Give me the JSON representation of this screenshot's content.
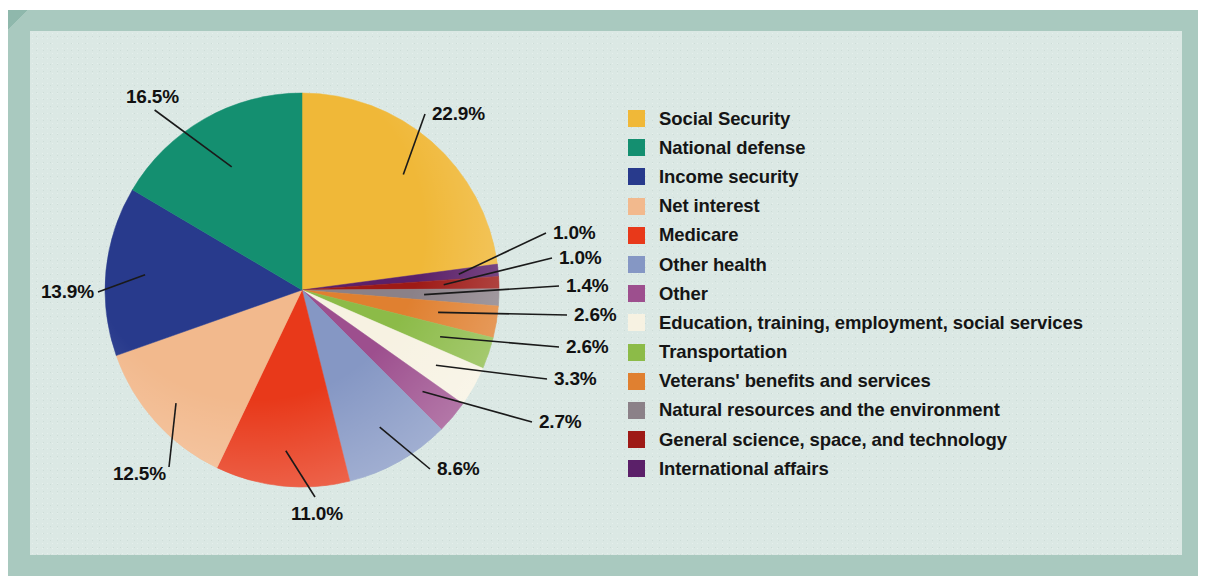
{
  "figure": {
    "background_color": "#dbe8e4",
    "frame_color": "#a9c9bf",
    "frame_shadow_color": "#8fb8ac"
  },
  "chart_data": {
    "type": "pie",
    "title": "",
    "subtitle": "",
    "xlabel": "",
    "ylabel": "",
    "legend_position": "right",
    "grid": false,
    "start_angle_deg": 0,
    "direction": "clockwise",
    "center": {
      "x": 302,
      "y": 290
    },
    "radius": 197,
    "categories": [
      "Social Security",
      "National defense",
      "Income security",
      "Net interest",
      "Medicare",
      "Other health",
      "Other",
      "Education, training, employment, social services",
      "Transportation",
      "Veterans' benefits and services",
      "Natural resources and the environment",
      "General science, space, and technology",
      "International affairs"
    ],
    "values": [
      22.9,
      16.5,
      13.9,
      12.5,
      11.0,
      8.6,
      2.7,
      3.3,
      2.6,
      2.6,
      1.4,
      1.0,
      1.0
    ],
    "value_labels": [
      "22.9%",
      "16.5%",
      "13.9%",
      "12.5%",
      "11.0%",
      "8.6%",
      "2.7%",
      "3.3%",
      "2.6%",
      "2.6%",
      "1.4%",
      "1.0%",
      "1.0%"
    ],
    "colors": [
      "#f0b838",
      "#148f70",
      "#283a8c",
      "#f2b98d",
      "#e8391a",
      "#8597c4",
      "#9d4f8e",
      "#f7f2e2",
      "#8cbb48",
      "#e08030",
      "#8b8188",
      "#9e1a16",
      "#5b2069"
    ],
    "slice_order_clockwise_from_top": [
      {
        "label": "Social Security",
        "value": 22.9,
        "color": "#f0b838"
      },
      {
        "label": "International affairs",
        "value": 1.0,
        "color": "#5b2069"
      },
      {
        "label": "General science, space, and technology",
        "value": 1.0,
        "color": "#9e1a16"
      },
      {
        "label": "Natural resources and the environment",
        "value": 1.4,
        "color": "#8b8188"
      },
      {
        "label": "Veterans' benefits and services",
        "value": 2.6,
        "color": "#e08030"
      },
      {
        "label": "Transportation",
        "value": 2.6,
        "color": "#8cbb48"
      },
      {
        "label": "Education, training, employment, social services",
        "value": 3.3,
        "color": "#f7f2e2"
      },
      {
        "label": "Other",
        "value": 2.7,
        "color": "#9d4f8e"
      },
      {
        "label": "Other health",
        "value": 8.6,
        "color": "#8597c4"
      },
      {
        "label": "Medicare",
        "value": 11.0,
        "color": "#e8391a"
      },
      {
        "label": "Net interest",
        "value": 12.5,
        "color": "#f2b98d"
      },
      {
        "label": "Income security",
        "value": 13.9,
        "color": "#283a8c"
      },
      {
        "label": "National defense",
        "value": 16.5,
        "color": "#148f70"
      }
    ]
  },
  "callouts": [
    {
      "name": "callout-social-security",
      "text": "22.9%",
      "x": 432,
      "y": 103
    },
    {
      "name": "callout-national-defense",
      "text": "16.5%",
      "x": 126,
      "y": 86
    },
    {
      "name": "callout-income-security",
      "text": "13.9%",
      "x": 41,
      "y": 281
    },
    {
      "name": "callout-net-interest",
      "text": "12.5%",
      "x": 113,
      "y": 463
    },
    {
      "name": "callout-medicare",
      "text": "11.0%",
      "x": 291,
      "y": 503
    },
    {
      "name": "callout-other-health",
      "text": "8.6%",
      "x": 437,
      "y": 458
    },
    {
      "name": "callout-other",
      "text": "2.7%",
      "x": 539,
      "y": 411
    },
    {
      "name": "callout-education",
      "text": "3.3%",
      "x": 554,
      "y": 368
    },
    {
      "name": "callout-transportation",
      "text": "2.6%",
      "x": 566,
      "y": 336
    },
    {
      "name": "callout-veterans",
      "text": "2.6%",
      "x": 574,
      "y": 304
    },
    {
      "name": "callout-natural-resources",
      "text": "1.4%",
      "x": 566,
      "y": 275
    },
    {
      "name": "callout-general-science",
      "text": "1.0%",
      "x": 559,
      "y": 247
    },
    {
      "name": "callout-international-affairs",
      "text": "1.0%",
      "x": 553,
      "y": 222
    }
  ],
  "legend": {
    "items": [
      {
        "label": "Social Security",
        "color": "#f0b838"
      },
      {
        "label": "National defense",
        "color": "#148f70"
      },
      {
        "label": "Income security",
        "color": "#283a8c"
      },
      {
        "label": "Net interest",
        "color": "#f2b98d"
      },
      {
        "label": "Medicare",
        "color": "#e8391a"
      },
      {
        "label": "Other health",
        "color": "#8597c4"
      },
      {
        "label": "Other",
        "color": "#9d4f8e"
      },
      {
        "label": "Education, training, employment, social services",
        "color": "#f7f2e2"
      },
      {
        "label": "Transportation",
        "color": "#8cbb48"
      },
      {
        "label": "Veterans' benefits and services",
        "color": "#e08030"
      },
      {
        "label": "Natural resources and the environment",
        "color": "#8b8188"
      },
      {
        "label": "General science, space, and technology",
        "color": "#9e1a16"
      },
      {
        "label": "International affairs",
        "color": "#5b2069"
      }
    ]
  }
}
